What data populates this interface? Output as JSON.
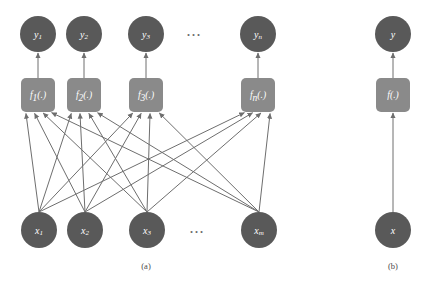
{
  "figure": {
    "title": "",
    "background_color": "#ffffff",
    "node_color": "#595959",
    "box_color": "#8a8a8a",
    "edge_color": "#6e6e6e",
    "label_color": "#ffffff",
    "caption_color": "#4a4a4a"
  },
  "panel_a": {
    "caption": "(a)",
    "caption_x": 146,
    "caption_y": 266,
    "output_nodes": [
      {
        "name": "y1",
        "base": "y",
        "sub": "1",
        "cx": 38,
        "cy": 34,
        "r": 18
      },
      {
        "name": "y2",
        "base": "y",
        "sub": "2",
        "cx": 84,
        "cy": 34,
        "r": 18
      },
      {
        "name": "y3",
        "base": "y",
        "sub": "3",
        "cx": 146,
        "cy": 34,
        "r": 18
      },
      {
        "name": "yn",
        "base": "y",
        "sub": "n",
        "cx": 258,
        "cy": 34,
        "r": 18
      }
    ],
    "function_boxes": [
      {
        "name": "f1",
        "base": "f",
        "sub": "1",
        "suffix": "(.)",
        "x": 21,
        "y": 78,
        "w": 34,
        "h": 34
      },
      {
        "name": "f2",
        "base": "f",
        "sub": "2",
        "suffix": "(.)",
        "x": 67,
        "y": 78,
        "w": 34,
        "h": 34
      },
      {
        "name": "f3",
        "base": "f",
        "sub": "3",
        "suffix": "(.)",
        "x": 129,
        "y": 78,
        "w": 34,
        "h": 34
      },
      {
        "name": "fn",
        "base": "f",
        "sub": "n",
        "suffix": "(.)",
        "x": 241,
        "y": 78,
        "w": 34,
        "h": 34
      }
    ],
    "input_nodes": [
      {
        "name": "x1",
        "base": "x",
        "sub": "1",
        "cx": 39,
        "cy": 230,
        "r": 18
      },
      {
        "name": "x2",
        "base": "x",
        "sub": "2",
        "cx": 85,
        "cy": 230,
        "r": 18
      },
      {
        "name": "x3",
        "base": "x",
        "sub": "3",
        "cx": 147,
        "cy": 230,
        "r": 18
      },
      {
        "name": "xm",
        "base": "x",
        "sub": "m",
        "cx": 259,
        "cy": 230,
        "r": 18
      }
    ],
    "ellipses": [
      {
        "name": "output-row-ellipsis",
        "text": "···",
        "x": 194,
        "y": 35
      },
      {
        "name": "input-row-ellipsis",
        "text": "···",
        "x": 197,
        "y": 232
      }
    ],
    "description": "Fully connected network: every input x connects to every function block f, each f feeds one output y"
  },
  "panel_b": {
    "caption": "(b)",
    "caption_x": 393,
    "caption_y": 266,
    "output_node": {
      "name": "y",
      "base": "y",
      "sub": "",
      "cx": 393,
      "cy": 34,
      "r": 18
    },
    "function_box": {
      "name": "f",
      "base": "f",
      "sub": "",
      "suffix": "(.)",
      "x": 376,
      "y": 78,
      "w": 34,
      "h": 34
    },
    "input_node": {
      "name": "x",
      "base": "x",
      "sub": "",
      "cx": 393,
      "cy": 230,
      "r": 18
    },
    "description": "Single vector-valued mapping: x feeds f(.) which produces y"
  }
}
